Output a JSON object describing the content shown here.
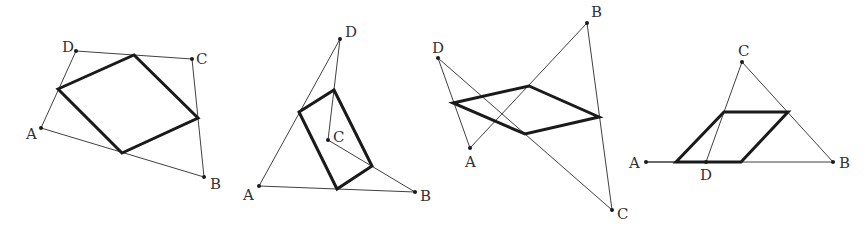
{
  "diagram": {
    "colors": {
      "thin_line": "#2a2a2a",
      "bold_line": "#1a1a1a",
      "label": "#333333",
      "background": "#ffffff"
    },
    "figures": [
      {
        "id": "fig1",
        "type": "convex quadrilateral",
        "outline": "A-B-C-D-A",
        "vertices": {
          "A": {
            "x": 41,
            "y": 128,
            "label": "A",
            "lx": 26,
            "ly": 139
          },
          "B": {
            "x": 204,
            "y": 177,
            "label": "B",
            "lx": 210,
            "ly": 189
          },
          "C": {
            "x": 192,
            "y": 59,
            "label": "C",
            "lx": 196,
            "ly": 64
          },
          "D": {
            "x": 76,
            "y": 51,
            "label": "D",
            "lx": 62,
            "ly": 52
          }
        },
        "parallelogram": [
          [
            58,
            89
          ],
          [
            134,
            55
          ],
          [
            198,
            118
          ],
          [
            122,
            153
          ]
        ]
      },
      {
        "id": "fig2",
        "type": "concave quadrilateral (C inside triangle ABD)",
        "outline": "A-B-C-D-A",
        "vertices": {
          "A": {
            "x": 259,
            "y": 186,
            "label": "A",
            "lx": 243,
            "ly": 200
          },
          "B": {
            "x": 415,
            "y": 192,
            "label": "B",
            "lx": 420,
            "ly": 201
          },
          "C": {
            "x": 328,
            "y": 140,
            "label": "C",
            "lx": 333,
            "ly": 142
          },
          "D": {
            "x": 340,
            "y": 39,
            "label": "D",
            "lx": 345,
            "ly": 37
          }
        },
        "parallelogram": [
          [
            299,
            112
          ],
          [
            334,
            90
          ],
          [
            372,
            166
          ],
          [
            337,
            189
          ]
        ]
      },
      {
        "id": "fig3",
        "type": "self-intersecting quadrilateral",
        "outline": "A-B-C-D-A",
        "vertices": {
          "A": {
            "x": 470,
            "y": 148,
            "label": "A",
            "lx": 465,
            "ly": 167
          },
          "B": {
            "x": 587,
            "y": 23,
            "label": "B",
            "lx": 591,
            "ly": 17
          },
          "C": {
            "x": 612,
            "y": 210,
            "label": "C",
            "lx": 617,
            "ly": 219
          },
          "D": {
            "x": 438,
            "y": 58,
            "label": "D",
            "lx": 432,
            "ly": 53
          }
        },
        "parallelogram": [
          [
            453,
            103
          ],
          [
            529,
            86
          ],
          [
            599,
            117
          ],
          [
            525,
            134
          ]
        ]
      },
      {
        "id": "fig4",
        "type": "degenerate quadrilateral (D on segment AB)",
        "outline": "A-B-C-D-A",
        "vertices": {
          "A": {
            "x": 646,
            "y": 162,
            "label": "A",
            "lx": 629,
            "ly": 168
          },
          "B": {
            "x": 833,
            "y": 162,
            "label": "B",
            "lx": 839,
            "ly": 168
          },
          "C": {
            "x": 742,
            "y": 62,
            "label": "C",
            "lx": 738,
            "ly": 56
          },
          "D": {
            "x": 706,
            "y": 162,
            "label": "D",
            "lx": 700,
            "ly": 180
          }
        },
        "parallelogram": [
          [
            676,
            162
          ],
          [
            724,
            112
          ],
          [
            788,
            112
          ],
          [
            741,
            162
          ]
        ]
      }
    ]
  }
}
